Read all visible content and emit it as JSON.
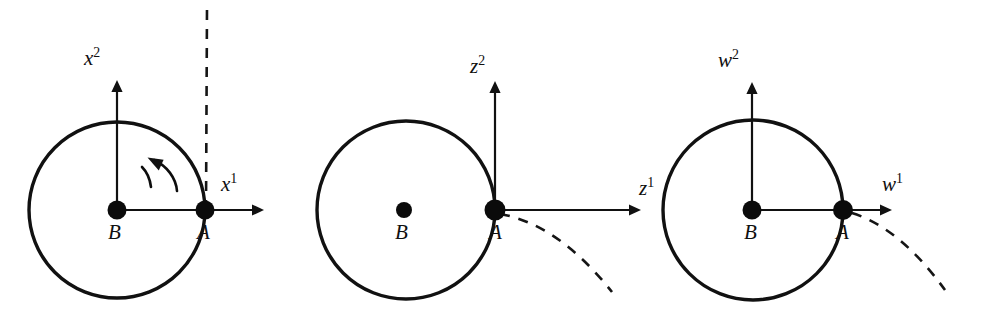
{
  "figure": {
    "background_color": "#ffffff",
    "ink_color": "#111111",
    "width": 991,
    "height": 313
  },
  "panels": [
    {
      "id": "panel-x",
      "frame": "x",
      "circle": {
        "cx": 117,
        "cy": 210,
        "r": 88
      },
      "points": [
        {
          "name": "B",
          "label": "B",
          "cx": 117,
          "cy": 210,
          "r": 9.5,
          "label_x": 108,
          "label_y": 222
        },
        {
          "name": "A",
          "label": "A",
          "cx": 205,
          "cy": 210,
          "r": 9.5,
          "label_x": 197,
          "label_y": 222
        }
      ],
      "axes": [
        {
          "name": "horizontal-axis",
          "base": "x",
          "superscript": "1",
          "label_x": 221,
          "label_y": 172,
          "x1": 117,
          "y1": 210,
          "x2": 258,
          "y2": 210
        },
        {
          "name": "vertical-axis",
          "base": "x",
          "superscript": "2",
          "label_x": 84,
          "label_y": 46,
          "x1": 117,
          "y1": 210,
          "x2": 117,
          "y2": 86
        }
      ],
      "dashed": {
        "name": "vertical-dashed-guide",
        "d": "M 206 210 L 207 8"
      },
      "rotation_arrow": {
        "name": "rotation-arrow",
        "direction": "counterclockwise"
      }
    },
    {
      "id": "panel-z",
      "frame": "z",
      "circle": {
        "cx": 406,
        "cy": 210,
        "r": 89
      },
      "points": [
        {
          "name": "B",
          "label": "B",
          "cx": 404,
          "cy": 210,
          "r": 8.0,
          "label_x": 395,
          "label_y": 222
        },
        {
          "name": "A",
          "label": "A",
          "cx": 495,
          "cy": 210,
          "r": 10.5,
          "label_x": 489,
          "label_y": 222
        }
      ],
      "axes": [
        {
          "name": "horizontal-axis",
          "base": "z",
          "superscript": "1",
          "label_x": 639,
          "label_y": 176,
          "x1": 495,
          "y1": 210,
          "x2": 635,
          "y2": 210
        },
        {
          "name": "vertical-axis",
          "base": "z",
          "superscript": "2",
          "label_x": 470,
          "label_y": 54,
          "x1": 495,
          "y1": 210,
          "x2": 495,
          "y2": 87
        }
      ],
      "dashed": {
        "name": "trajectory-dashed-curve",
        "d": "M 500 214 Q 558 224 612 292"
      },
      "rotation_arrow": null
    },
    {
      "id": "panel-w",
      "frame": "w",
      "circle": {
        "cx": 753,
        "cy": 210,
        "r": 90
      },
      "points": [
        {
          "name": "B",
          "label": "B",
          "cx": 752,
          "cy": 210,
          "r": 9.5,
          "label_x": 744,
          "label_y": 222
        },
        {
          "name": "A",
          "label": "A",
          "cx": 843,
          "cy": 210,
          "r": 10.0,
          "label_x": 836,
          "label_y": 222
        }
      ],
      "axes": [
        {
          "name": "horizontal-axis",
          "base": "w",
          "superscript": "1",
          "label_x": 882,
          "label_y": 172,
          "x1": 752,
          "y1": 210,
          "x2": 888,
          "y2": 210
        },
        {
          "name": "vertical-axis",
          "base": "w",
          "superscript": "2",
          "label_x": 718,
          "label_y": 48,
          "x1": 752,
          "y1": 210,
          "x2": 752,
          "y2": 88
        }
      ],
      "dashed": {
        "name": "trajectory-dashed-curve",
        "d": "M 852 213 Q 900 228 945 290"
      },
      "rotation_arrow": null
    }
  ]
}
